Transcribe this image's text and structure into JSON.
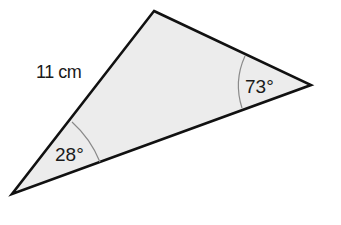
{
  "figure": {
    "type": "triangle",
    "colors": {
      "fill": "#ececec",
      "stroke": "#111111",
      "arc": "#8a8a8a",
      "background": "#ffffff"
    },
    "vertices": {
      "top": [
        154,
        11
      ],
      "right": [
        311,
        85
      ],
      "left": [
        12,
        194
      ]
    },
    "side_label": "11 cm",
    "angles": {
      "left": "28°",
      "right": "73°"
    }
  }
}
